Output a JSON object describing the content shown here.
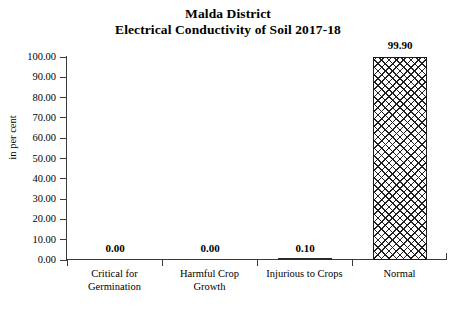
{
  "title": {
    "line1": "Malda District",
    "line2": "Electrical Conductivity of Soil 2017-18"
  },
  "chart_data": {
    "type": "bar",
    "title": "Malda District Electrical Conductivity of Soil 2017-18",
    "categories": [
      "Critical for Germination",
      "Harmful Crop Growth",
      "Injurious to Crops",
      "Normal"
    ],
    "category_lines": [
      [
        "Critical for",
        "Germination"
      ],
      [
        "Harmful Crop",
        "Growth"
      ],
      [
        "Injurious to Crops",
        ""
      ],
      [
        "Normal",
        ""
      ]
    ],
    "values": [
      0.0,
      0.0,
      0.1,
      99.9
    ],
    "data_labels": [
      "0.00",
      "0.00",
      "0.10",
      "99.90"
    ],
    "xlabel": "",
    "ylabel": "in per cent",
    "ylim": [
      0,
      100
    ],
    "ytick_step": 10,
    "yticks": [
      0,
      10,
      20,
      30,
      40,
      50,
      60,
      70,
      80,
      90,
      100
    ],
    "ytick_labels": [
      "0.00",
      "10.00",
      "20.00",
      "30.00",
      "40.00",
      "50.00",
      "60.00",
      "70.00",
      "80.00",
      "90.00",
      "100.00"
    ],
    "grid": false,
    "legend": false,
    "bar_fill": "diagonal-crosshatch",
    "bar_color": "#202020",
    "axis_color": "#3a3a3a"
  }
}
